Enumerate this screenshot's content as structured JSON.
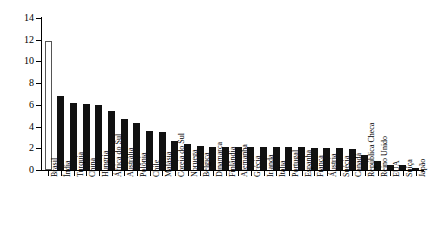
{
  "chart_data": {
    "type": "bar",
    "title": "",
    "subtitle": "",
    "xlabel": "",
    "ylabel": "",
    "ylim": [
      0,
      14
    ],
    "yticks": [
      0,
      2,
      4,
      6,
      8,
      10,
      12,
      14
    ],
    "grid": false,
    "legend": "none",
    "highlight_category": "Brasil",
    "highlight_style": "hollow-white-bar-with-outline",
    "categories": [
      "Brasil",
      "Índia",
      "Turquia",
      "China",
      "Hungria",
      "África do Sul",
      "Austrália",
      "Polônia",
      "Chile",
      "Malásia",
      "Coreia do Sul",
      "Noruega",
      "Bélgica",
      "Dinamarca",
      "Finlândia",
      "Alemanha",
      "Grécia",
      "Irlanda",
      "Itália",
      "Portugal",
      "Espanha",
      "França",
      "Áustria",
      "Suécia",
      "Canadá",
      "República Checa",
      "Reino Unido",
      "EUA",
      "Suíça",
      "Japão"
    ],
    "values": [
      11.9,
      6.8,
      6.2,
      6.1,
      6.0,
      5.4,
      4.7,
      4.3,
      3.6,
      3.5,
      2.7,
      2.4,
      2.2,
      2.1,
      2.1,
      2.1,
      2.1,
      2.1,
      2.1,
      2.1,
      2.1,
      2.0,
      2.0,
      2.0,
      1.9,
      1.4,
      0.8,
      0.5,
      0.5,
      0.15
    ],
    "colors": {
      "bar": "#111111",
      "highlight_fill": "#ffffff",
      "highlight_stroke": "#555555",
      "axis": "#000000",
      "text": "#000000",
      "background": "#ffffff"
    }
  }
}
